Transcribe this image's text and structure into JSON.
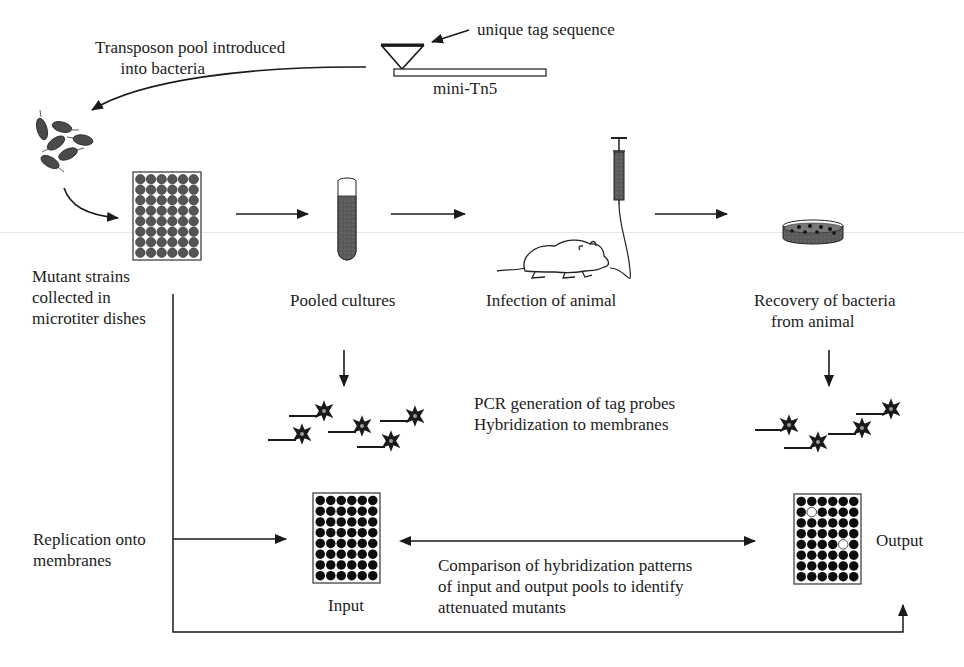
{
  "figure": {
    "type": "STM (signature-tagged mutagenesis) workflow diagram",
    "colors": {
      "ink": "#1a1a1a",
      "well_gray": "#555555",
      "well_black": "#0d0d0d",
      "membrane_empty": "#ffffff",
      "scan_line": "#e6e6e6"
    }
  },
  "labels": {
    "transposon_pool": "Transposon pool introduced\n      into bacteria",
    "unique_tag": "unique tag sequence",
    "mini_tn5": "mini-Tn5",
    "mutant_strains": "Mutant strains\ncollected in\nmicrotiter dishes",
    "pooled_cultures": "Pooled cultures",
    "infection": "Infection of animal",
    "recovery": "Recovery of bacteria\n    from animal",
    "pcr": "PCR generation of tag probes\nHybridization to membranes",
    "replication": "Replication onto\nmembranes",
    "comparison": "Comparison of hybridization patterns\nof input and output pools to identify\nattenuated mutants",
    "input": "Input",
    "output": "Output"
  },
  "plates": {
    "microtiter": {
      "rows": 8,
      "cols": 6,
      "well_color": "gray"
    },
    "input_membrane": {
      "rows": 8,
      "cols": 6,
      "missing_wells": []
    },
    "output_membrane": {
      "rows": 8,
      "cols": 6,
      "missing_wells": [
        [
          2,
          2
        ],
        [
          5,
          5
        ]
      ]
    }
  },
  "probes": {
    "input_side_count": 5,
    "output_side_count": 4
  },
  "icons": [
    "bacteria-icon",
    "microtiter-plate-icon",
    "test-tube-icon",
    "syringe-icon",
    "mouse-icon",
    "petri-dish-icon",
    "transposon-icon",
    "probe-star-icon",
    "membrane-icon"
  ]
}
